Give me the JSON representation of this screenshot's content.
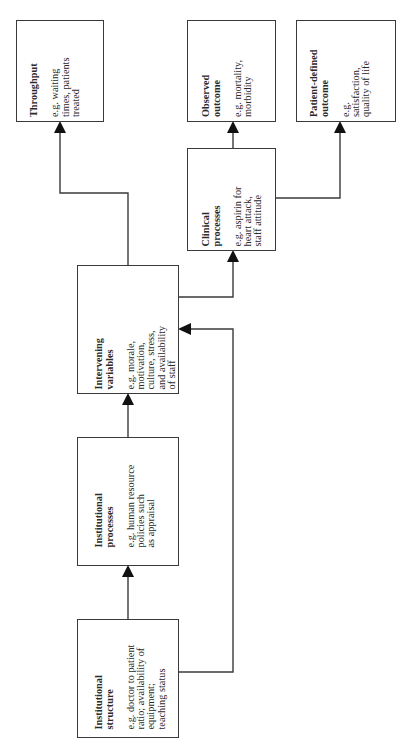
{
  "diagram": {
    "orientation": "rotated -90deg (text reads bottom-to-top)",
    "boxes": {
      "throughput": {
        "title": "Throughput",
        "body": "e.g. waiting\ntimes, patients\ntreated"
      },
      "observed_outcome": {
        "title": "Observed\noutcome",
        "body": "e.g. mortality,\nmorbidity"
      },
      "patient_defined_outcome": {
        "title": "Patient-defined\noutcome",
        "body": "e.g.\nsatisfaction,\nquality of life"
      },
      "clinical_processes": {
        "title": "Clinical\nprocesses",
        "body": "e.g. aspirin for\nheart attack,\nstaff  attitude"
      },
      "intervening_variables": {
        "title": "Intervening\nvariables",
        "body": "e.g. morale,\nmotivation,\nculture, stress,\nand availability\nof staff"
      },
      "institutional_processes": {
        "title": "Institutional\nprocesses",
        "body": "e.g. human resource\npolicies such\nas appraisal"
      },
      "institutional_structure": {
        "title": "Institutional\nstructure",
        "body": "e.g. doctor to patient\nratio;  availability of\nequipment;\nteaching status"
      }
    },
    "edges": [
      {
        "from": "institutional_structure",
        "to": "institutional_processes"
      },
      {
        "from": "institutional_structure",
        "to": "intervening_variables"
      },
      {
        "from": "institutional_processes",
        "to": "intervening_variables"
      },
      {
        "from": "intervening_variables",
        "to": "throughput"
      },
      {
        "from": "intervening_variables",
        "to": "clinical_processes"
      },
      {
        "from": "clinical_processes",
        "to": "observed_outcome"
      },
      {
        "from": "clinical_processes",
        "to": "patient_defined_outcome"
      }
    ],
    "colors": {
      "line": "#3a3a3a",
      "text": "#2a2a2a",
      "background": "#ffffff"
    }
  }
}
